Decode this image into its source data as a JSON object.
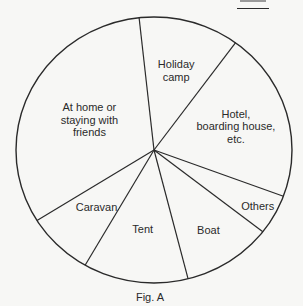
{
  "figure": {
    "caption": "Fig. A",
    "stroke_color": "#2a2a2a",
    "background": "#f7f7f5"
  },
  "chart_data": {
    "type": "pie",
    "title": "",
    "caption": "Fig. A",
    "start_angle_deg": 353.8,
    "direction": "clockwise",
    "slices": [
      {
        "label": "Holiday camp",
        "lines": [
          "Holiday",
          "camp"
        ],
        "value": 11.8
      },
      {
        "label": "Hotel, boarding house, etc.",
        "lines": [
          "Hotel,",
          "boarding house,",
          "etc."
        ],
        "value": 20.6
      },
      {
        "label": "Others",
        "lines": [
          "Others"
        ],
        "value": 4.9
      },
      {
        "label": "Boat",
        "lines": [
          "Boat"
        ],
        "value": 10.5
      },
      {
        "label": "Tent",
        "lines": [
          "Tent"
        ],
        "value": 12.3
      },
      {
        "label": "Caravan",
        "lines": [
          "Caravan"
        ],
        "value": 7.8
      },
      {
        "label": "At home or staying with friends",
        "lines": [
          "At home or",
          "staying with",
          "friends"
        ],
        "value": 32.2
      }
    ],
    "units": "approx. percent (estimated from angles, not labeled)",
    "legend": "none (labels inside slices)"
  }
}
